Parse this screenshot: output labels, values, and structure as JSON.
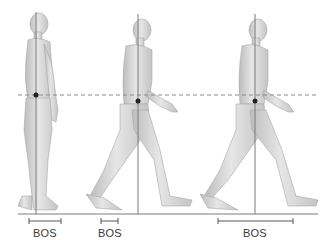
{
  "diagram": {
    "title": "",
    "colors": {
      "background": "#ffffff",
      "skin": "#d8d8d8",
      "skin_shadow": "#b4b4b4",
      "line": "#7a7a7a",
      "dashed_line": "#8a8a8a",
      "com_dot": "#222222",
      "label": "#3a3a3a"
    },
    "ground_line": {
      "y": 214,
      "x1": 18,
      "x2": 318
    },
    "com_height_line": {
      "y": 95,
      "x1": 18,
      "x2": 318,
      "style": "dashed"
    },
    "figures": [
      {
        "pose": "standing",
        "gravity_line_x": 36,
        "com_y": 95,
        "bos": {
          "x1": 29,
          "x2": 61,
          "label": "BOS"
        }
      },
      {
        "pose": "walking-double-support-short",
        "gravity_line_x": 138,
        "com_y": 101,
        "bos": {
          "x1": 101,
          "x2": 118,
          "label": "BOS"
        }
      },
      {
        "pose": "walking-double-support-long",
        "gravity_line_x": 255,
        "com_y": 101,
        "bos": {
          "x1": 218,
          "x2": 293,
          "label": "BOS"
        }
      }
    ],
    "labels": [
      "BOS",
      "BOS",
      "BOS"
    ]
  }
}
